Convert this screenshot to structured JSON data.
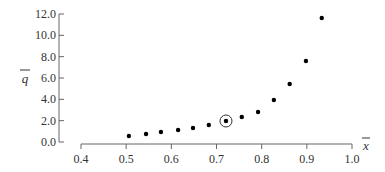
{
  "chart_data": {
    "type": "scatter",
    "title": "",
    "xlabel": "x̄",
    "ylabel": "q̄",
    "xlim": [
      0.4,
      1.0
    ],
    "ylim": [
      0.0,
      12.0
    ],
    "grid": false,
    "legend": null,
    "x_ticks": [
      "0.4",
      "0.5",
      "0.6",
      "0.7",
      "0.8",
      "0.9",
      "1.0"
    ],
    "y_ticks": [
      "0.0",
      "2.0",
      "4.0",
      "6.0",
      "8.0",
      "10.0",
      "12.0"
    ],
    "series": [
      {
        "name": "data",
        "x": [
          0.506,
          0.544,
          0.577,
          0.615,
          0.648,
          0.683,
          0.721,
          0.756,
          0.792,
          0.827,
          0.862,
          0.898,
          0.933
        ],
        "y": [
          0.56,
          0.75,
          0.94,
          1.12,
          1.31,
          1.59,
          1.97,
          2.34,
          2.81,
          3.94,
          5.44,
          7.59,
          11.62
        ]
      }
    ],
    "annotations": [
      {
        "type": "circle-highlight",
        "x": 0.721,
        "y": 1.97
      }
    ]
  },
  "axes": {
    "x_label": "x",
    "y_label": "q"
  }
}
